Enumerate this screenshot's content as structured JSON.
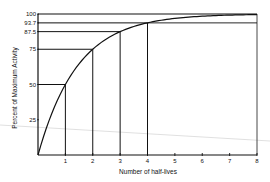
{
  "chart_data": {
    "type": "line",
    "title": "",
    "xlabel": "Number of half-lives",
    "ylabel": "Percent of Maximum Activity",
    "x": [
      0,
      1,
      2,
      3,
      4,
      5,
      6,
      7,
      8
    ],
    "series": [
      {
        "name": "Activity",
        "values": [
          0,
          50,
          75,
          87.5,
          93.7,
          96.9,
          98.4,
          99.2,
          100
        ]
      }
    ],
    "x_ticks": [
      "1",
      "2",
      "3",
      "4",
      "5",
      "6",
      "7",
      "8"
    ],
    "y_ticks": [
      "25",
      "50",
      "75",
      "87.5",
      "93.7",
      "100"
    ],
    "xlim": [
      0,
      8
    ],
    "ylim": [
      0,
      100
    ],
    "grid": false,
    "legend": null,
    "annotations": [
      {
        "type": "drop-lines",
        "points": [
          [
            1,
            50
          ],
          [
            2,
            75
          ],
          [
            3,
            87.5
          ],
          [
            4,
            93.7
          ]
        ]
      }
    ]
  }
}
